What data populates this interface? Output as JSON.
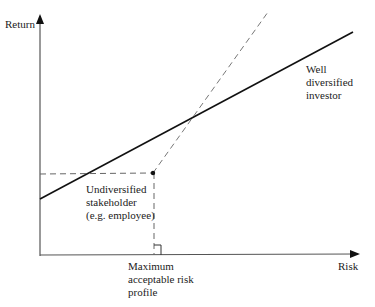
{
  "diagram": {
    "type": "risk-return line diagram",
    "axes": {
      "y_label": "Return",
      "x_label": "Risk"
    },
    "lines": [
      {
        "name": "Well diversified investor",
        "style": "solid",
        "color": "#111111"
      },
      {
        "name": "Undiversified stakeholder",
        "style": "dashed",
        "color": "#666666"
      }
    ],
    "annotations": {
      "well_diversified": [
        "Well",
        "diversified",
        "investor"
      ],
      "undiversified": [
        "Undiversified",
        "stakeholder",
        "(e.g. employee)"
      ],
      "max_risk": [
        "Maximum",
        "acceptable risk",
        "profile"
      ]
    },
    "colors": {
      "axis": "#333333",
      "solid_line": "#111111",
      "dashed_line": "#777777",
      "guide_dash": "#555555"
    }
  }
}
